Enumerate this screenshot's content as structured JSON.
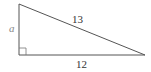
{
  "diagram": {
    "type": "right-triangle",
    "labels": {
      "vertical_leg": "a",
      "hypotenuse": "13",
      "horizontal_leg": "12"
    },
    "right_angle_marker": true,
    "stroke_color": "#555555"
  }
}
